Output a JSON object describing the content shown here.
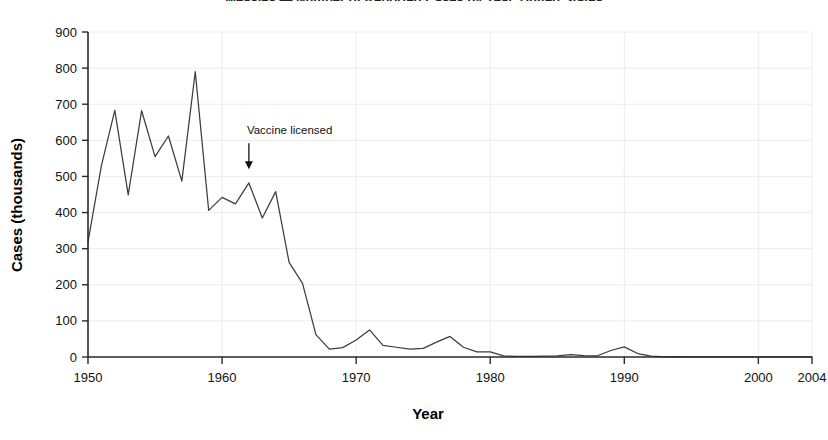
{
  "chart_data": {
    "type": "line",
    "title": "Measles — Number of Reported Cases by Year, United States",
    "xlabel": "Year",
    "ylabel": "Cases (thousands)",
    "xlim": [
      1950,
      2004
    ],
    "ylim": [
      0,
      900
    ],
    "grid": true,
    "legend": "none",
    "xticks": [
      1950,
      1960,
      1970,
      1980,
      1990,
      2000,
      2004
    ],
    "yticks": [
      0,
      100,
      200,
      300,
      400,
      500,
      600,
      700,
      800,
      900
    ],
    "annotations": [
      {
        "text": "Vaccine licensed",
        "x": 1962,
        "y": 600,
        "arrow": "down",
        "arrow_to_y": 520
      }
    ],
    "series": [
      {
        "name": "Reported measles cases (thousands)",
        "color": "#3d3d3d",
        "x": [
          1950,
          1951,
          1952,
          1953,
          1954,
          1955,
          1956,
          1957,
          1958,
          1959,
          1960,
          1961,
          1962,
          1963,
          1964,
          1965,
          1966,
          1967,
          1968,
          1969,
          1970,
          1971,
          1972,
          1973,
          1974,
          1975,
          1976,
          1977,
          1978,
          1979,
          1980,
          1981,
          1982,
          1983,
          1984,
          1985,
          1986,
          1987,
          1988,
          1989,
          1990,
          1991,
          1992,
          1993,
          1994,
          1995,
          1996,
          1997,
          1998,
          1999,
          2000,
          2001,
          2002,
          2003,
          2004
        ],
        "values": [
          319,
          530,
          683,
          449,
          682,
          555,
          612,
          487,
          790,
          406,
          442,
          424,
          482,
          385,
          458,
          262,
          204,
          62,
          22,
          26,
          47,
          75,
          32,
          27,
          22,
          24,
          41,
          57,
          27,
          14,
          14,
          3,
          2,
          1.5,
          2.6,
          2.8,
          6.3,
          3.7,
          3.4,
          18,
          28,
          9.6,
          2.2,
          0.3,
          0.96,
          0.3,
          0.5,
          0.14,
          0.1,
          0.1,
          0.09,
          0.12,
          0.04,
          0.06,
          0.04
        ]
      }
    ]
  },
  "axes": {
    "y_label": "Cases (thousands)",
    "x_label": "Year",
    "y_ticks": [
      "0",
      "100",
      "200",
      "300",
      "400",
      "500",
      "600",
      "700",
      "800",
      "900"
    ],
    "x_ticks": [
      "1950",
      "1960",
      "1970",
      "1980",
      "1990",
      "2000",
      "2004"
    ]
  },
  "annotation": {
    "text": "Vaccine licensed"
  },
  "title": {
    "text": "Measles — Number of Reported Cases by Year, United States"
  }
}
